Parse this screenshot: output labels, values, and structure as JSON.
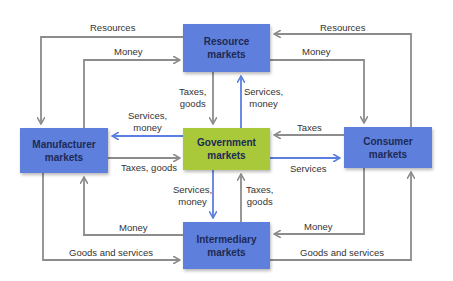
{
  "colors": {
    "market_box": "#5f7fdc",
    "government_box": "#a9c83a",
    "gray_arrow": "#8c8c8c",
    "blue_arrow": "#5b7fe0",
    "label_text": "#333333"
  },
  "nodes": {
    "resource": {
      "line1": "Resource",
      "line2": "markets"
    },
    "manufacturer": {
      "line1": "Manufacturer",
      "line2": "markets"
    },
    "government": {
      "line1": "Government",
      "line2": "markets"
    },
    "consumer": {
      "line1": "Consumer",
      "line2": "markets"
    },
    "intermediary": {
      "line1": "Intermediary",
      "line2": "markets"
    }
  },
  "flows": {
    "resource_to_manufacturer": "Resources",
    "manufacturer_to_resource": "Money",
    "consumer_to_resource": "Resources",
    "resource_to_consumer": "Money",
    "resource_to_government": {
      "line1": "Taxes,",
      "line2": "goods"
    },
    "government_to_resource": {
      "line1": "Services,",
      "line2": "money"
    },
    "government_to_manufacturer": {
      "line1": "Services,",
      "line2": "money"
    },
    "manufacturer_to_government": "Taxes, goods",
    "consumer_to_government": "Taxes",
    "government_to_consumer": "Services",
    "government_to_intermediary": {
      "line1": "Services,",
      "line2": "money"
    },
    "intermediary_to_government": {
      "line1": "Taxes,",
      "line2": "goods"
    },
    "intermediary_to_manufacturer": "Money",
    "manufacturer_to_intermediary": "Goods and services",
    "consumer_to_intermediary": "Money",
    "intermediary_to_consumer": "Goods and services"
  }
}
